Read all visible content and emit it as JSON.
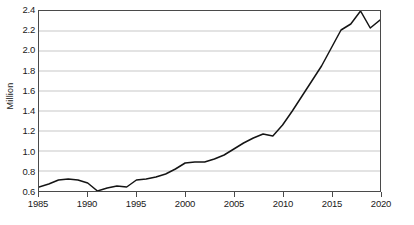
{
  "chart_data": {
    "type": "line",
    "title": "",
    "subtitle": "",
    "xlabel": "",
    "ylabel": "Million",
    "xlim": [
      1985,
      2020
    ],
    "ylim": [
      0.6,
      2.4
    ],
    "ytick_step": 0.2,
    "xtick_step": 5,
    "grid": "horizontal",
    "legend": "none",
    "line_color": "#141414",
    "grid_color": "#b8b8b8",
    "axis_color": "#4a4a4a",
    "ytick_labels": [
      "2.4",
      "2.2",
      "2.0",
      "1.8",
      "1.6",
      "1.4",
      "1.2",
      "1.0",
      "0.8",
      "0.6"
    ],
    "ytick_values": [
      2.4,
      2.2,
      2.0,
      1.8,
      1.6,
      1.4,
      1.2,
      1.0,
      0.8,
      0.6
    ],
    "xtick_labels": [
      "1985",
      "1990",
      "1995",
      "2000",
      "2005",
      "2010",
      "2015",
      "2020"
    ],
    "xtick_values": [
      1985,
      1990,
      1995,
      2000,
      2005,
      2010,
      2015,
      2020
    ],
    "x": [
      1985,
      1986,
      1987,
      1988,
      1989,
      1990,
      1991,
      1992,
      1993,
      1994,
      1995,
      1996,
      1997,
      1998,
      1999,
      2000,
      2001,
      2002,
      2003,
      2004,
      2005,
      2006,
      2007,
      2008,
      2009,
      2010,
      2011,
      2012,
      2013,
      2014,
      2015,
      2016,
      2017,
      2018,
      2019,
      2020
    ],
    "values": [
      0.64,
      0.67,
      0.71,
      0.72,
      0.71,
      0.68,
      0.6,
      0.63,
      0.65,
      0.64,
      0.71,
      0.72,
      0.74,
      0.77,
      0.82,
      0.88,
      0.89,
      0.89,
      0.92,
      0.96,
      1.02,
      1.08,
      1.13,
      1.17,
      1.15,
      1.26,
      1.4,
      1.55,
      1.7,
      1.85,
      2.03,
      2.21,
      2.27,
      2.4,
      2.23,
      2.31
    ],
    "series": [
      {
        "name": "",
        "values": [
          0.64,
          0.67,
          0.71,
          0.72,
          0.71,
          0.68,
          0.6,
          0.63,
          0.65,
          0.64,
          0.71,
          0.72,
          0.74,
          0.77,
          0.82,
          0.88,
          0.89,
          0.89,
          0.92,
          0.96,
          1.02,
          1.08,
          1.13,
          1.17,
          1.15,
          1.26,
          1.4,
          1.55,
          1.7,
          1.85,
          2.03,
          2.21,
          2.27,
          2.4,
          2.23,
          2.31
        ]
      }
    ]
  }
}
